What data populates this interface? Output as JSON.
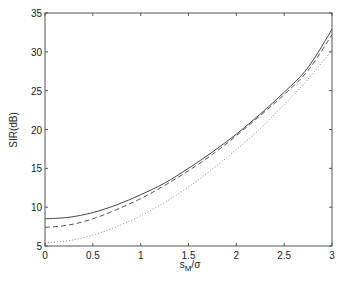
{
  "chart_data": {
    "type": "line",
    "title": "",
    "xlabel": "s_M/σ",
    "xlabel_main": "s",
    "xlabel_sub": "M",
    "xlabel_tail": "/σ",
    "ylabel": "SIR(dB)",
    "xlim": [
      0,
      3
    ],
    "ylim": [
      5,
      35
    ],
    "grid": false,
    "legend": null,
    "xticks": [
      0,
      0.5,
      1,
      1.5,
      2,
      2.5,
      3
    ],
    "xtick_labels": [
      "0",
      "0.5",
      "1",
      "1.5",
      "2",
      "2.5",
      "3"
    ],
    "yticks": [
      5,
      10,
      15,
      20,
      25,
      30,
      35
    ],
    "ytick_labels": [
      "5",
      "10",
      "15",
      "20",
      "25",
      "30",
      "35"
    ],
    "x": [
      0,
      0.25,
      0.5,
      0.75,
      1,
      1.25,
      1.5,
      1.75,
      2,
      2.25,
      2.5,
      2.75,
      3
    ],
    "series": [
      {
        "name": "solid",
        "style": "solid",
        "values": [
          8.5,
          8.7,
          9.3,
          10.3,
          11.6,
          13.1,
          15.0,
          17.1,
          19.4,
          22.0,
          24.8,
          28.0,
          32.9
        ]
      },
      {
        "name": "dashed",
        "style": "dashed",
        "values": [
          7.4,
          7.7,
          8.5,
          9.7,
          11.1,
          12.8,
          14.7,
          16.8,
          19.2,
          21.8,
          24.5,
          27.6,
          32.2
        ]
      },
      {
        "name": "dotted",
        "style": "dotted",
        "values": [
          5.4,
          5.7,
          6.4,
          7.5,
          8.9,
          10.6,
          12.6,
          14.9,
          17.4,
          20.1,
          23.2,
          26.5,
          30.2
        ]
      }
    ]
  }
}
